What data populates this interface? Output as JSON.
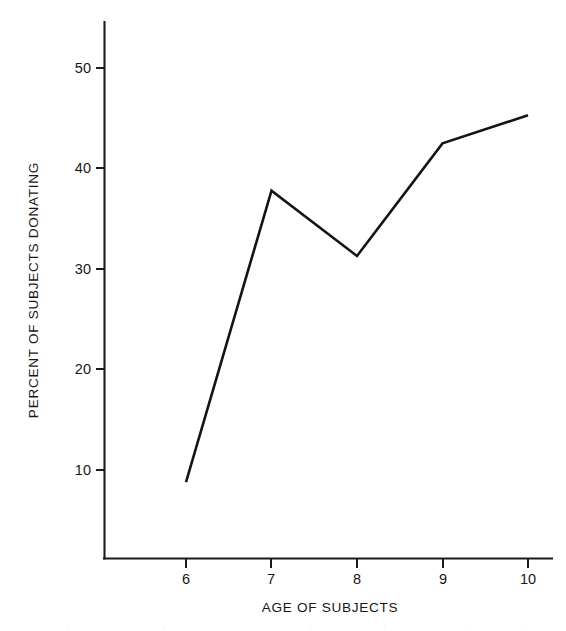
{
  "chart_data": {
    "type": "line",
    "title": "",
    "xlabel": "AGE OF SUBJECTS",
    "ylabel": "PERCENT OF SUBJECTS DONATING",
    "x": [
      6,
      7,
      8,
      9,
      10
    ],
    "categories": [
      "6",
      "7",
      "8",
      "9",
      "10"
    ],
    "values": [
      8.8,
      37.8,
      31.3,
      42.5,
      45.3
    ],
    "series": [
      {
        "name": "Percent of subjects donating",
        "values": [
          8.8,
          37.8,
          31.3,
          42.5,
          45.3
        ]
      }
    ],
    "xlim": [
      5.05,
      10.25
    ],
    "ylim": [
      0,
      54
    ],
    "xticks": [
      6,
      7,
      8,
      9,
      10
    ],
    "xtick_labels": [
      "6",
      "7",
      "8",
      "9",
      "10"
    ],
    "yticks": [
      10,
      20,
      30,
      40,
      50
    ],
    "ytick_labels": [
      "10",
      "20",
      "30",
      "40",
      "50"
    ],
    "grid": false,
    "legend": false,
    "legend_position": "none",
    "line_color": "#141414",
    "markers": false,
    "annotations": []
  },
  "axes": {
    "x_title": "AGE OF SUBJECTS",
    "y_title": "PERCENT OF SUBJECTS DONATING",
    "y_ticks": [
      {
        "label": "50",
        "value": 50
      },
      {
        "label": "40",
        "value": 40
      },
      {
        "label": "30",
        "value": 30
      },
      {
        "label": "20",
        "value": 20
      },
      {
        "label": "10",
        "value": 10
      }
    ],
    "x_ticks": [
      {
        "label": "6",
        "value": 6
      },
      {
        "label": "7",
        "value": 7
      },
      {
        "label": "8",
        "value": 8
      },
      {
        "label": "9",
        "value": 9
      },
      {
        "label": "10",
        "value": 10
      }
    ]
  }
}
